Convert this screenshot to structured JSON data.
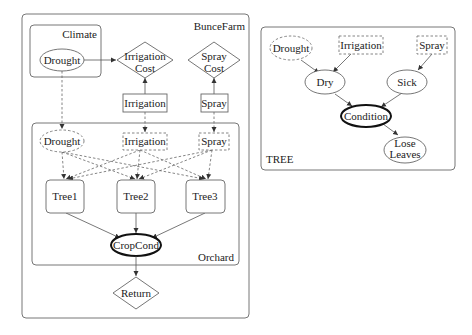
{
  "farm": {
    "title": "BunceFarm",
    "climate": {
      "title": "Climate",
      "drought": "Drought"
    },
    "irrigation_cost": [
      "Irrigation",
      "Cost"
    ],
    "spray_cost": [
      "Spray",
      "Cost"
    ],
    "irrigation": "Irrigation",
    "spray": "Spray",
    "orchard": {
      "title": "Orchard",
      "drought": "Drought",
      "irrigation": "Irrigation",
      "spray": "Spray",
      "trees": [
        "Tree1",
        "Tree2",
        "Tree3"
      ],
      "crop_cond": "CropCond"
    },
    "return": "Return"
  },
  "tree": {
    "title": "TREE",
    "drought": "Drought",
    "irrigation": "Irrigation",
    "spray": "Spray",
    "dry": "Dry",
    "sick": "Sick",
    "condition": "Condition",
    "lose_leaves": [
      "Lose",
      "Leaves"
    ]
  }
}
